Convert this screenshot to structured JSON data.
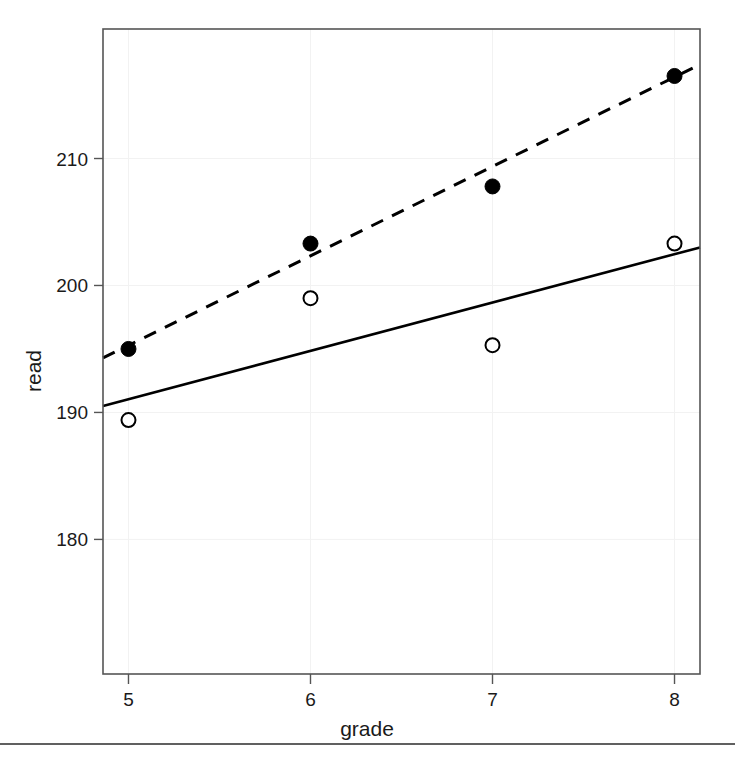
{
  "chart_data": {
    "type": "scatter",
    "title": "",
    "subtitle": "",
    "xlabel": "grade",
    "ylabel": "read",
    "x": [
      5,
      6,
      7,
      8
    ],
    "xticks": [
      5,
      6,
      7,
      8
    ],
    "xtick_labels": [
      "5",
      "6",
      "7",
      "8"
    ],
    "yticks": [
      180,
      190,
      200,
      210
    ],
    "ytick_labels": [
      "180",
      "190",
      "200",
      "210"
    ],
    "xlim": [
      4.86,
      8.14
    ],
    "ylim": [
      169.4,
      220.2
    ],
    "grid": true,
    "legend": "none",
    "series": [
      {
        "name": "filled-points",
        "marker": "filled-circle",
        "values": [
          195.0,
          203.3,
          207.8,
          216.5
        ],
        "fit_line": {
          "style": "dashed",
          "x_endpoints": [
            4.86,
            8.14
          ],
          "y_endpoints": [
            194.3,
            217.4
          ]
        }
      },
      {
        "name": "open-points",
        "marker": "open-circle",
        "values": [
          189.4,
          199.0,
          195.3,
          203.3
        ],
        "fit_line": {
          "style": "solid",
          "x_endpoints": [
            4.86,
            8.14
          ],
          "y_endpoints": [
            190.5,
            203.0
          ]
        }
      }
    ],
    "annotations": []
  },
  "colors": {
    "line": "#000000",
    "frame": "#555555",
    "grid": "#f2f2f2",
    "text": "#1a1a1a",
    "background": "#ffffff"
  },
  "figure": {
    "bottom_rule": true
  }
}
